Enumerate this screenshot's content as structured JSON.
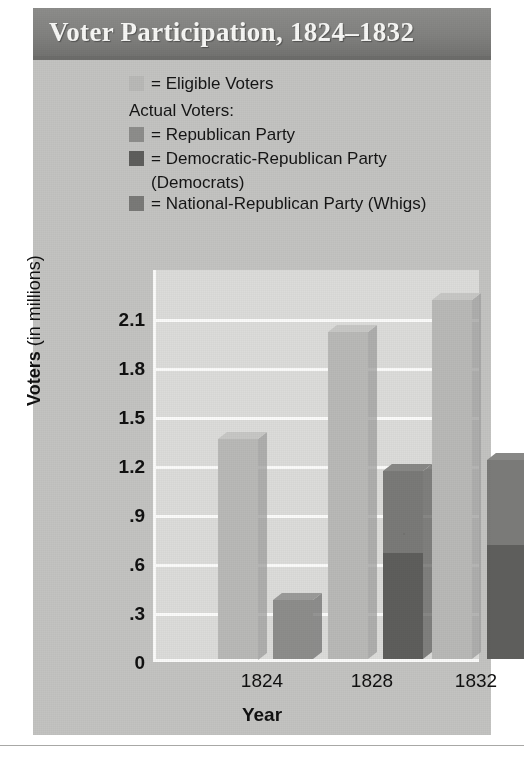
{
  "figure": {
    "title": "Voter Participation, 1824–1832",
    "colors": {
      "eligible": "#b9b9b7",
      "republican": "#8d8d8b",
      "democratic_republican": "#5e5e5c",
      "national_republican": "#7a7a78",
      "plot_background": "#dcdcda",
      "card_background": "#c3c3c1",
      "gridline": "#fbfbfa",
      "banner": "#828280",
      "text": "#151515"
    }
  },
  "legend": {
    "eligible_label": "= Eligible Voters",
    "actual_heading": "Actual Voters:",
    "republican_label": "= Republican Party",
    "democratic_republican_label": "= Democratic-Republican Party",
    "democratic_republican_sub": "(Democrats)",
    "national_republican_label": "= National-Republican Party (Whigs)"
  },
  "chart_data": {
    "type": "bar",
    "title": "Voter Participation, 1824–1832",
    "subtitle": "",
    "xlabel": "Year",
    "ylabel": "Voters (in millions)",
    "categories": [
      "1824",
      "1828",
      "1832"
    ],
    "ylim": [
      0,
      2.4
    ],
    "yticks": [
      "0",
      ".3",
      ".6",
      ".9",
      "1.2",
      "1.5",
      "1.8",
      "2.1"
    ],
    "ytick_values": [
      0,
      0.3,
      0.6,
      0.9,
      1.2,
      1.5,
      1.8,
      2.1
    ],
    "grid": true,
    "legend_position": "top-left",
    "stacked_actual": true,
    "series": [
      {
        "name": "Eligible Voters",
        "color": "#b9b9b7",
        "values": [
          1.35,
          2.0,
          2.2
        ]
      },
      {
        "name": "Republican Party",
        "color": "#8d8d8b",
        "values": [
          0.36,
          null,
          null
        ]
      },
      {
        "name": "Democratic-Republican Party (Democrats)",
        "color": "#5e5e5c",
        "values": [
          null,
          0.65,
          0.7
        ]
      },
      {
        "name": "National-Republican Party (Whigs)",
        "color": "#7a7a78",
        "values": [
          null,
          0.5,
          0.52
        ]
      }
    ],
    "actual_totals": [
      0.36,
      1.15,
      1.22
    ],
    "annotations": []
  },
  "axis": {
    "y_label_prefix": "Voters",
    "y_label_suffix": " (in millions)",
    "x_label": "Year"
  }
}
